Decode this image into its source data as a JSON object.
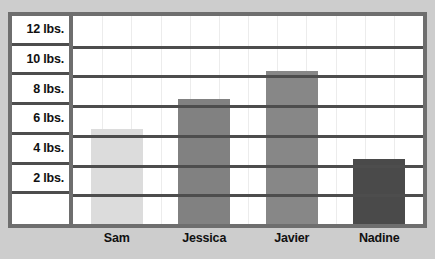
{
  "title": "",
  "chart_data": {
    "type": "bar",
    "title": "",
    "subtitle": "",
    "xlabel": "",
    "ylabel": "",
    "categories": [
      "Sam",
      "Jessica",
      "Javier",
      "Nadine"
    ],
    "values": [
      6.4,
      8.4,
      10.3,
      4.4
    ],
    "series": [
      {
        "name": "Weight",
        "values": [
          6.4,
          8.4,
          10.3,
          4.4
        ]
      }
    ],
    "bar_colors": [
      "#dcdcdc",
      "#818181",
      "#878787",
      "#4a4a4a"
    ],
    "ylim": [
      0,
      14
    ],
    "ytick_values": [
      2,
      4,
      6,
      8,
      10,
      12
    ],
    "ytick_labels": [
      "2 lbs.",
      "4 lbs.",
      "6 lbs.",
      "8 lbs.",
      "10 lbs.",
      "12 lbs."
    ],
    "unit": "lbs.",
    "grid": true,
    "legend": false,
    "legend_position": "none"
  },
  "axis": {
    "y_labels": [
      "12 lbs.",
      "10 lbs.",
      "8 lbs.",
      "6 lbs.",
      "4 lbs.",
      "2 lbs."
    ],
    "x_labels": [
      "Sam",
      "Jessica",
      "Javier",
      "Nadine"
    ]
  },
  "colors": {
    "page_background": "#cdcdcd",
    "frame_border": "#6e6e6e",
    "gridline": "#4d4d4d",
    "plot_background": "#ffffff",
    "text": "#111111",
    "bar_sam": "#dcdcdc",
    "bar_jessica": "#818181",
    "bar_javier": "#878787",
    "bar_nadine": "#4a4a4a"
  }
}
